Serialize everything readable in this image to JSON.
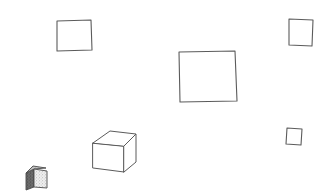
{
  "canvas": {
    "width": 334,
    "height": 195,
    "background_color": "#ffffff",
    "stroke_color": "#5b5b5b",
    "description": "Hand-drawn line sketch of scattered squares and cubes on a plain white background"
  },
  "shapes": [
    {
      "id": "square-top-left",
      "label": "Square",
      "kind": "square-outline",
      "points": "57,21 91,20 92,50 57,51",
      "bbox": {
        "x": 57,
        "y": 20,
        "w": 35,
        "h": 31
      },
      "fill": "#ffffff",
      "stroke": "#5b5b5b"
    },
    {
      "id": "square-top-right",
      "label": "Square",
      "kind": "square-outline",
      "points": "289,19 313,20 312,46 289,45",
      "bbox": {
        "x": 289,
        "y": 19,
        "w": 24,
        "h": 27
      },
      "fill": "#ffffff",
      "stroke": "#5b5b5b"
    },
    {
      "id": "square-center-large",
      "label": "Large square",
      "kind": "square-outline",
      "points": "179,52 235,51 237,101 180,102",
      "bbox": {
        "x": 179,
        "y": 51,
        "w": 58,
        "h": 51
      },
      "fill": "#ffffff",
      "stroke": "#5b5b5b"
    },
    {
      "id": "square-right-small",
      "label": "Small square",
      "kind": "square-outline",
      "points": "287,128 302,129 301,145 286,144",
      "bbox": {
        "x": 286,
        "y": 128,
        "w": 16,
        "h": 17
      },
      "fill": "#ffffff",
      "stroke": "#5b5b5b"
    },
    {
      "id": "cube-large-wireframe",
      "label": "Cube",
      "kind": "cube-3d-outline",
      "bbox": {
        "x": 92,
        "y": 130,
        "w": 44,
        "h": 42
      },
      "fill": "#ffffff",
      "stroke": "#5b5b5b",
      "geometry": {
        "front_face": "93,143 124,146 124,172 93,168",
        "top_face": "93,143 110,131 136,134 124,146",
        "right_face": "124,146 136,134 136,162 124,172"
      }
    },
    {
      "id": "cube-small-textured",
      "label": "Textured cube",
      "kind": "cube-3d-shaded",
      "bbox": {
        "x": 25,
        "y": 166,
        "w": 23,
        "h": 24
      },
      "fill": "#d8d8d8",
      "stroke": "#4a4a4a",
      "geometry": {
        "left_face": "26,173 34,169 34,187 26,190",
        "front_face": "34,169 47,171 47,188 34,187",
        "top_face": "26,173 33,166 46,168 34,169"
      },
      "shading": {
        "left_face_tone": "#6f6f6f",
        "front_face_tone": "#e4e4e4",
        "top_face_tone": "#bdbdbd",
        "texture": "stipple"
      }
    }
  ]
}
